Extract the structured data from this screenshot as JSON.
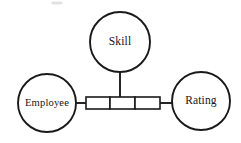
{
  "diagram": {
    "type": "entity-relationship-diagram",
    "title": "",
    "stroke_color": "#1a1a1a",
    "fill_color": "#ffffff",
    "background_color": "#ffffff",
    "entities": [
      {
        "id": "skill",
        "label": "Skill",
        "shape": "circle",
        "cx": 120,
        "cy": 42,
        "r": 30
      },
      {
        "id": "employee",
        "label": "Employee",
        "shape": "circle",
        "cx": 47,
        "cy": 103,
        "r": 29
      },
      {
        "id": "rating",
        "label": "Rating",
        "shape": "circle",
        "cx": 201,
        "cy": 101,
        "r": 29
      }
    ],
    "relationship": {
      "id": "relationship-box",
      "shape": "segmented-rectangle",
      "x": 86,
      "y": 97,
      "width": 74,
      "height": 12,
      "cells": [
        {
          "id": "relationship-cell-1",
          "label": ""
        },
        {
          "id": "relationship-cell-2",
          "label": ""
        },
        {
          "id": "relationship-cell-3",
          "label": ""
        }
      ],
      "divider_offsets": [
        24,
        49
      ]
    },
    "connectors": [
      {
        "id": "connector-skill",
        "from": "skill",
        "to": "relationship-box",
        "x1": 120,
        "y1": 72,
        "x2": 120,
        "y2": 97,
        "orientation": "vertical"
      },
      {
        "id": "connector-employee",
        "from": "employee",
        "to": "relationship-box",
        "x1": 75,
        "y1": 103,
        "x2": 86,
        "y2": 103,
        "orientation": "horizontal"
      },
      {
        "id": "connector-rating",
        "from": "relationship-box",
        "to": "rating",
        "x1": 160,
        "y1": 103,
        "x2": 173,
        "y2": 103,
        "orientation": "horizontal"
      }
    ]
  }
}
